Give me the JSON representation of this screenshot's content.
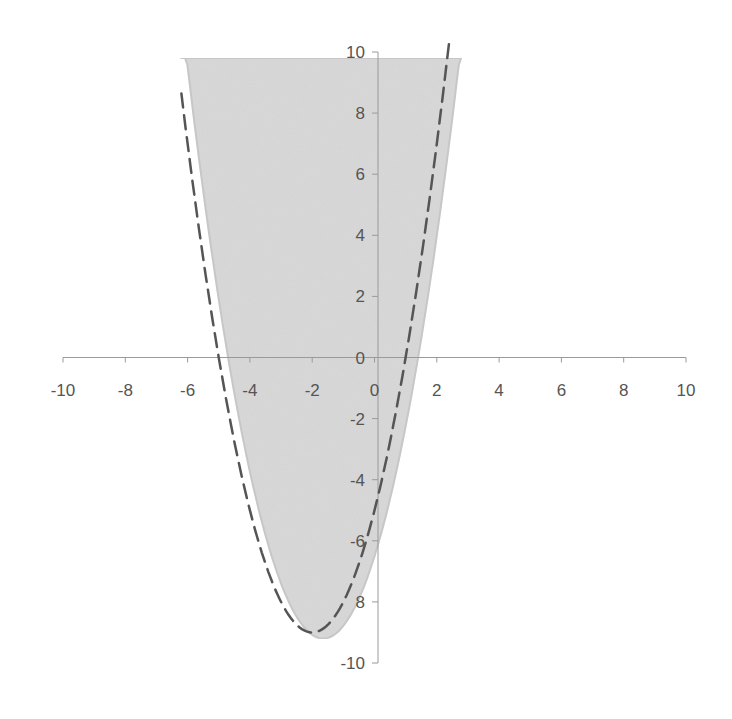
{
  "chart_data": {
    "type": "area",
    "title": "",
    "xlabel": "",
    "ylabel": "",
    "xlim": [
      -10,
      10
    ],
    "ylim": [
      -10,
      10
    ],
    "grid": false,
    "legend": null,
    "x_ticks": [
      -10,
      -8,
      -6,
      -4,
      -2,
      0,
      2,
      4,
      6,
      8,
      10
    ],
    "y_ticks": [
      10,
      8,
      6,
      4,
      2,
      0,
      -2,
      -4,
      -6,
      -8,
      -10
    ],
    "x_tick_labels": [
      "-10",
      "-8",
      "-6",
      "-4",
      "-2",
      "0",
      "2",
      "4",
      "6",
      "8",
      "10"
    ],
    "y_tick_labels": [
      "10",
      "8",
      "6",
      "4",
      "2",
      "0",
      "-2",
      "-4",
      "-6",
      "8",
      "-10"
    ],
    "series": [
      {
        "name": "shaded-region",
        "kind": "filled-parabola",
        "description": "Region above parabola, bounded above at y≈9.8",
        "color": "#dadada",
        "edge_color": "#c8c8c8",
        "vertex": [
          -1.65,
          -9.2
        ],
        "a": 0.99,
        "top_y": 9.8,
        "x_intercepts": [
          -4.7,
          1.4
        ]
      },
      {
        "name": "dashed-parabola",
        "kind": "dashed-curve",
        "equation": "y = x^2 + 4x - 5",
        "color": "#555555",
        "vertex": [
          -2,
          -9
        ],
        "x_intercepts": [
          -5,
          1
        ],
        "x_range": [
          -6.2,
          2.4
        ]
      }
    ]
  }
}
